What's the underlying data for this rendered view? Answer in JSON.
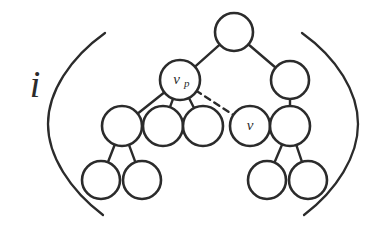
{
  "figure": {
    "caption_symbol": "i",
    "stroke_color": "#2b2b2b",
    "background_color": "#ffffff",
    "node_fill": "#ffffff"
  },
  "labels": {
    "index": "i",
    "parent_node_base": "v",
    "parent_node_subscript": "p",
    "child_node": "v",
    "left_bracket": "(",
    "right_bracket": ")"
  },
  "nodes": [
    {
      "id": "root",
      "cx": 234,
      "cy": 32,
      "r": 19,
      "label": "",
      "sublabel": ""
    },
    {
      "id": "vp",
      "cx": 180,
      "cy": 80,
      "r": 20,
      "label": "v",
      "sublabel": "p"
    },
    {
      "id": "r1",
      "cx": 290,
      "cy": 80,
      "r": 19,
      "label": "",
      "sublabel": ""
    },
    {
      "id": "c1",
      "cx": 122,
      "cy": 126,
      "r": 20,
      "label": "",
      "sublabel": ""
    },
    {
      "id": "c2",
      "cx": 163,
      "cy": 126,
      "r": 20,
      "label": "",
      "sublabel": ""
    },
    {
      "id": "c3",
      "cx": 203,
      "cy": 126,
      "r": 20,
      "label": "",
      "sublabel": ""
    },
    {
      "id": "v",
      "cx": 250,
      "cy": 126,
      "r": 20,
      "label": "v",
      "sublabel": ""
    },
    {
      "id": "r2",
      "cx": 290,
      "cy": 126,
      "r": 20,
      "label": "",
      "sublabel": ""
    },
    {
      "id": "b1",
      "cx": 101,
      "cy": 180,
      "r": 19,
      "label": "",
      "sublabel": ""
    },
    {
      "id": "b2",
      "cx": 142,
      "cy": 180,
      "r": 19,
      "label": "",
      "sublabel": ""
    },
    {
      "id": "b3",
      "cx": 267,
      "cy": 180,
      "r": 19,
      "label": "",
      "sublabel": ""
    },
    {
      "id": "b4",
      "cx": 308,
      "cy": 180,
      "r": 19,
      "label": "",
      "sublabel": ""
    }
  ],
  "edges": [
    {
      "from": "root",
      "to": "vp",
      "style": "solid"
    },
    {
      "from": "root",
      "to": "r1",
      "style": "solid"
    },
    {
      "from": "vp",
      "to": "c1",
      "style": "solid"
    },
    {
      "from": "vp",
      "to": "c2",
      "style": "solid"
    },
    {
      "from": "vp",
      "to": "c3",
      "style": "solid"
    },
    {
      "from": "vp",
      "to": "v",
      "style": "dashed"
    },
    {
      "from": "r1",
      "to": "r2",
      "style": "solid"
    },
    {
      "from": "c1",
      "to": "b1",
      "style": "solid"
    },
    {
      "from": "c1",
      "to": "b2",
      "style": "solid"
    },
    {
      "from": "r2",
      "to": "b3",
      "style": "solid"
    },
    {
      "from": "r2",
      "to": "b4",
      "style": "solid"
    }
  ],
  "brackets": {
    "left": {
      "x_tip": 48,
      "y_top": 33,
      "y_bottom": 215,
      "x_end_top": 105,
      "x_end_bottom": 103
    },
    "right": {
      "x_tip": 358,
      "y_top": 33,
      "y_bottom": 215,
      "x_end_top": 302,
      "x_end_bottom": 304
    }
  },
  "index_label_position": {
    "x": 35,
    "y": 88
  }
}
